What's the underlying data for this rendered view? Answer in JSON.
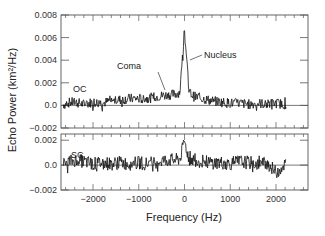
{
  "chart_data": {
    "type": "line",
    "xlabel": "Frequency (Hz)",
    "ylabel": "Echo Power (km²/Hz)",
    "x_ticks": [
      -2000,
      -1000,
      0,
      1000,
      2000
    ],
    "x_tick_labels": [
      "−2000",
      "−1000",
      "0",
      "1000",
      "2000"
    ],
    "xlim": [
      -2700,
      2700
    ],
    "panels": [
      {
        "name": "OC",
        "ylim": [
          -0.002,
          0.008
        ],
        "y_ticks": [
          -0.002,
          0.0,
          0.002,
          0.004,
          0.006,
          0.008
        ],
        "y_tick_labels": [
          "−0.002",
          "0.0",
          "0.002",
          "0.004",
          "0.006",
          "0.008"
        ],
        "annotations": [
          {
            "text": "Coma",
            "x": -600,
            "y": 0.0013
          },
          {
            "text": "Nucleus",
            "x": 30,
            "y": 0.0035
          }
        ],
        "series": {
          "x": [
            -2600,
            -2400,
            -2200,
            -2000,
            -1800,
            -1600,
            -1400,
            -1200,
            -1000,
            -800,
            -600,
            -400,
            -200,
            -100,
            0,
            100,
            200,
            400,
            600,
            800,
            1000,
            1200,
            1400,
            1600,
            1800,
            2000,
            2200
          ],
          "y": [
            0.0002,
            0.0003,
            0.0001,
            0.0003,
            0.0002,
            0.0004,
            0.0005,
            0.0006,
            0.0006,
            0.0006,
            0.0008,
            0.0009,
            0.001,
            0.0012,
            0.0066,
            0.0012,
            0.0008,
            0.0006,
            0.0004,
            0.0003,
            0.0002,
            0.0002,
            0.0001,
            0.0002,
            0.0001,
            0.0002,
            0.0001
          ]
        }
      },
      {
        "name": "SC",
        "ylim": [
          -0.002,
          0.0025
        ],
        "y_ticks": [
          -0.002,
          0.0,
          0.002
        ],
        "y_tick_labels": [
          "−0.002",
          "0.0",
          "0.002"
        ],
        "series": {
          "x": [
            -2600,
            -2400,
            -2200,
            -2000,
            -1800,
            -1600,
            -1400,
            -1200,
            -1000,
            -800,
            -600,
            -400,
            -200,
            -100,
            0,
            100,
            200,
            400,
            600,
            800,
            1000,
            1200,
            1400,
            1600,
            1800,
            2000,
            2200
          ],
          "y": [
            0.0002,
            0.0004,
            0.0003,
            0.0001,
            0.0002,
            0.0001,
            0.0002,
            0.0001,
            0.0002,
            0.0001,
            0.0003,
            0.0004,
            0.0004,
            0.0005,
            0.0019,
            0.0005,
            0.0004,
            0.0003,
            0.0002,
            0.0002,
            0.0001,
            0.0003,
            0.0002,
            0.0001,
            0.0002,
            -0.0006,
            0.0001
          ]
        }
      }
    ]
  }
}
